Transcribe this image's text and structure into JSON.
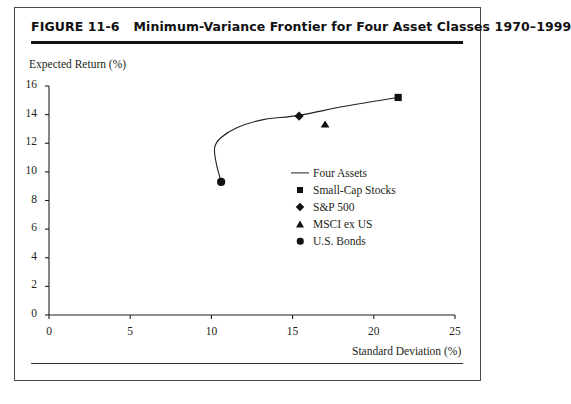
{
  "figure": {
    "number": "FIGURE 11-6",
    "title": "Minimum-Variance Frontier for Four Asset Classes 1970–1999"
  },
  "chart_data": {
    "type": "scatter",
    "title": "Minimum-Variance Frontier for Four Asset Classes 1970–1999",
    "xlabel": "Standard Deviation (%)",
    "ylabel": "Expected Return (%)",
    "xlim": [
      0,
      25
    ],
    "ylim": [
      0,
      16
    ],
    "xticks": [
      0,
      5,
      10,
      15,
      20,
      25
    ],
    "yticks": [
      0,
      2,
      4,
      6,
      8,
      10,
      12,
      14,
      16
    ],
    "grid": false,
    "legend_position": "center-right",
    "series": [
      {
        "name": "Four Assets",
        "marker": "line",
        "type": "line",
        "points": [
          [
            10.6,
            9.3
          ],
          [
            10.3,
            10.6
          ],
          [
            10.2,
            11.7
          ],
          [
            10.6,
            12.4
          ],
          [
            11.6,
            13.1
          ],
          [
            13.2,
            13.65
          ],
          [
            15.4,
            13.95
          ],
          [
            18.3,
            14.6
          ],
          [
            21.5,
            15.2
          ]
        ]
      },
      {
        "name": "Small-Cap Stocks",
        "marker": "square",
        "type": "point",
        "points": [
          [
            21.5,
            15.2
          ]
        ]
      },
      {
        "name": "S&P 500",
        "marker": "diamond",
        "type": "point",
        "points": [
          [
            15.4,
            13.9
          ]
        ]
      },
      {
        "name": "MSCI ex US",
        "marker": "triangle",
        "type": "point",
        "points": [
          [
            17.0,
            13.35
          ]
        ]
      },
      {
        "name": "U.S. Bonds",
        "marker": "circle",
        "type": "point",
        "points": [
          [
            10.6,
            9.3
          ]
        ]
      }
    ]
  },
  "legend": {
    "items": [
      {
        "label": "Four Assets",
        "marker": "line"
      },
      {
        "label": "Small-Cap Stocks",
        "marker": "square"
      },
      {
        "label": "S&P 500",
        "marker": "diamond"
      },
      {
        "label": "MSCI ex US",
        "marker": "triangle"
      },
      {
        "label": "U.S. Bonds",
        "marker": "circle"
      }
    ]
  },
  "colors": {
    "ink": "#231f20",
    "marker": "#111111",
    "frame": "#4a4a4a"
  }
}
